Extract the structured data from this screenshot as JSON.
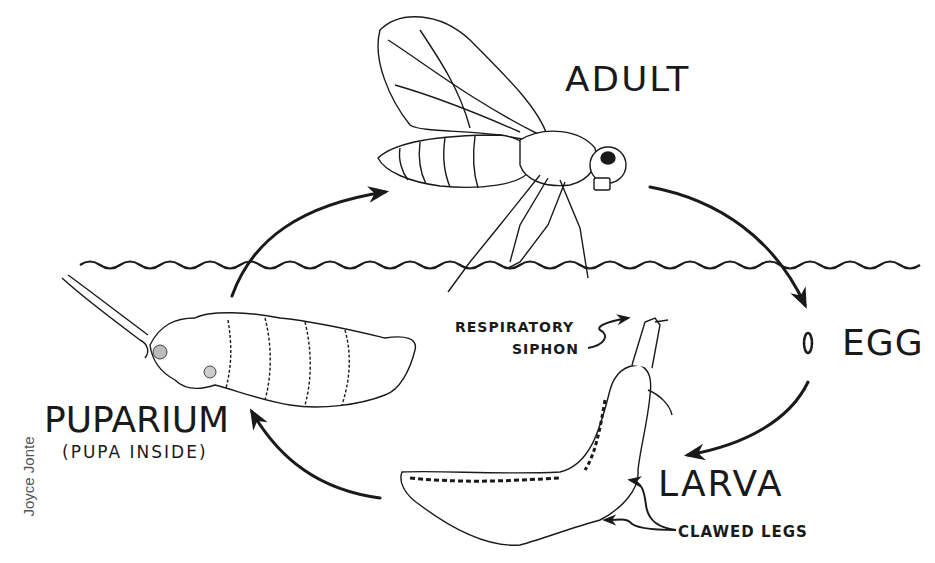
{
  "diagram": {
    "stages": [
      {
        "id": "adult",
        "label": "ADULT"
      },
      {
        "id": "egg",
        "label": "EGG"
      },
      {
        "id": "larva",
        "label": "LARVA"
      },
      {
        "id": "puparium",
        "label": "PUPARIUM",
        "sublabel": "(PUPA INSIDE)"
      }
    ],
    "annotations": {
      "respiratory_siphon_line1": "RESPIRATORY",
      "respiratory_siphon_line2": "SIPHON",
      "clawed_legs": "CLAWED LEGS"
    },
    "cycle_order": [
      "ADULT",
      "EGG",
      "LARVA",
      "PUPARIUM",
      "ADULT"
    ],
    "credit": "Joyce Jonte",
    "colors": {
      "ink": "#1a1a1a",
      "background": "#ffffff",
      "credit_text": "#555555"
    }
  }
}
